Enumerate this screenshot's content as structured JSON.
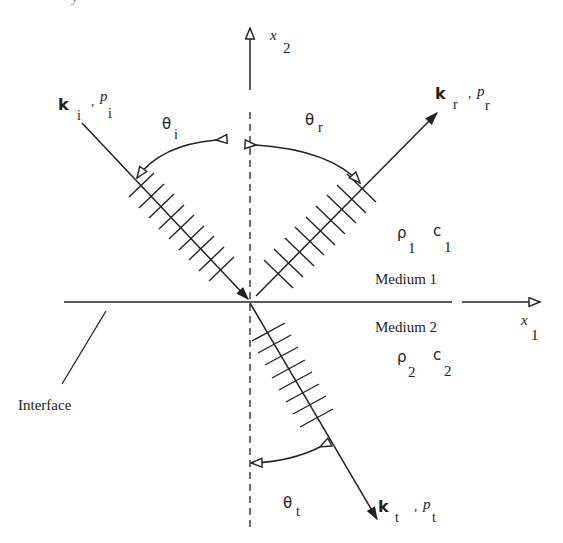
{
  "diagram": {
    "title_fragment": "y",
    "axes": {
      "x1": {
        "symbol": "x",
        "subscript": "1"
      },
      "x2": {
        "symbol": "x",
        "subscript": "2"
      }
    },
    "waves": {
      "incident": {
        "vector": "k",
        "vector_sub": "i",
        "sep": ",",
        "pressure": "p",
        "pressure_sub": "i",
        "angle": "θ",
        "angle_sub": "i"
      },
      "reflected": {
        "vector": "k",
        "vector_sub": "r",
        "sep": ",",
        "pressure": "p",
        "pressure_sub": "r",
        "angle": "θ",
        "angle_sub": "r"
      },
      "transmitted": {
        "vector": "k",
        "vector_sub": "t",
        "sep": ",",
        "pressure": "p",
        "pressure_sub": "t",
        "angle": "θ",
        "angle_sub": "t"
      }
    },
    "media": {
      "medium1": {
        "label": "Medium 1",
        "density": "ρ",
        "density_sub": "1",
        "speed": "c",
        "speed_sub": "1"
      },
      "medium2": {
        "label": "Medium 2",
        "density": "ρ",
        "density_sub": "2",
        "speed": "c",
        "speed_sub": "2"
      }
    },
    "interface_label": "Interface",
    "colors": {
      "stroke": "#222222",
      "background": "#ffffff"
    }
  }
}
